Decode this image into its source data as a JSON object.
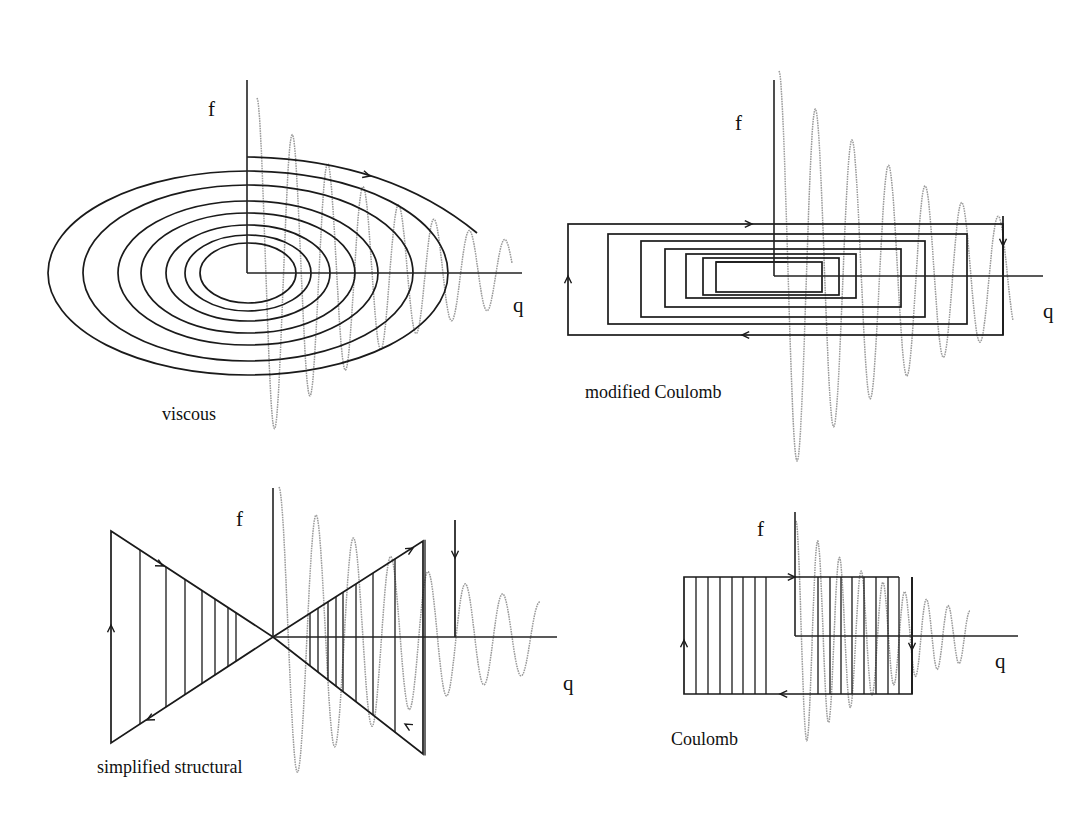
{
  "figure": {
    "panels": [
      {
        "id": "viscous",
        "title": "viscous",
        "f_label": "f",
        "q_label": "q",
        "origin": [
          247,
          273
        ],
        "axis_top": 80,
        "axis_right": 522,
        "label_pos": {
          "f": [
            208,
            116
          ],
          "q": [
            513,
            312
          ],
          "title": [
            162,
            420
          ]
        },
        "loops": {
          "type": "ellipses",
          "center": [
            248,
            273
          ],
          "radii": [
            [
              200,
              102
            ],
            [
              165,
              88
            ],
            [
              130,
              72
            ],
            [
              107,
              60
            ],
            [
              82,
              48
            ],
            [
              63,
              38
            ],
            [
              48,
              30
            ]
          ],
          "start_top": [
            247,
            157
          ]
        },
        "wave": {
          "x0": 257,
          "x1": 512,
          "cycles": 7.2,
          "amp0": 175,
          "amp1": 32,
          "yc": 273
        }
      },
      {
        "id": "modified-coulomb",
        "title": "modified Coulomb",
        "f_label": "f",
        "q_label": "q",
        "origin": [
          774,
          276
        ],
        "axis_top": 80,
        "axis_right": 1043,
        "label_pos": {
          "f": [
            735,
            130
          ],
          "q": [
            1043,
            318
          ],
          "title": [
            585,
            398
          ]
        },
        "loops": {
          "type": "rects",
          "rects": [
            [
              568,
              224,
              1003,
              335
            ],
            [
              608,
              234,
              967,
              324
            ],
            [
              641,
              241,
              925,
              317
            ],
            [
              665,
              249,
              901,
              307
            ],
            [
              686,
              254,
              856,
              298
            ],
            [
              703,
              258,
              839,
              295
            ],
            [
              716,
              262,
              822,
              292
            ]
          ]
        },
        "wave": {
          "x0": 779,
          "x1": 1013,
          "cycles": 6.4,
          "amp0": 205,
          "amp1": 55,
          "yc": 276
        }
      },
      {
        "id": "simplified-structural",
        "title": "simplified structural",
        "f_label": "f",
        "q_label": "q",
        "origin": [
          273,
          637
        ],
        "axis_top": 488,
        "axis_right": 557,
        "label_pos": {
          "f": [
            236,
            526
          ],
          "q": [
            563,
            690
          ],
          "title": [
            97,
            773
          ]
        },
        "loops": {
          "type": "bowtie",
          "left_x": 111,
          "right_x": 455,
          "top_left_y": 531,
          "bottom_left_y": 743,
          "top_right_y": 541,
          "bottom_right_y": 754,
          "hatch_left": [
            140,
            166,
            185,
            202,
            215,
            228,
            236
          ],
          "hatch_right": [
            310,
            318,
            328,
            336,
            343,
            356,
            373,
            395,
            425
          ]
        },
        "wave": {
          "x0": 279,
          "x1": 540,
          "cycles": 7.0,
          "amp0": 150,
          "amp1": 35,
          "yc": 637
        }
      },
      {
        "id": "coulomb",
        "title": "Coulomb",
        "f_label": "f",
        "q_label": "q",
        "origin": [
          795,
          636
        ],
        "axis_top": 512,
        "axis_right": 1018,
        "label_pos": {
          "f": [
            757,
            536
          ],
          "q": [
            995,
            668
          ],
          "title": [
            671,
            745
          ]
        },
        "loops": {
          "type": "hatched-rect",
          "rect": [
            684,
            577,
            912,
            694
          ],
          "top_right_x": 899,
          "hatch_left": [
            696,
            708,
            720,
            732,
            743,
            755,
            766
          ],
          "hatch_right": [
            818,
            830,
            841,
            852,
            864,
            876,
            888
          ]
        },
        "wave": {
          "x0": 796,
          "x1": 970,
          "cycles": 8.0,
          "amp0": 115,
          "amp1": 25,
          "yc": 636
        }
      }
    ],
    "colors": {
      "line": "#1a1a1a",
      "wave": "#9a9a9a",
      "background": "#ffffff"
    }
  }
}
